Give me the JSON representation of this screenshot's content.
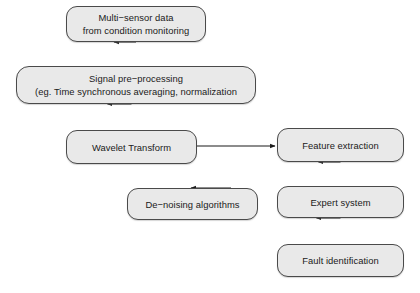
{
  "diagram": {
    "background_color": "#ffffff",
    "node_fill_color": "#e9e9e9",
    "node_border_color": "#4a4a4a",
    "edge_color": "#1a1a1a",
    "nodes": [
      {
        "id": "source",
        "lines": [
          "Multi−sensor data",
          "from condition monitoring"
        ]
      },
      {
        "id": "preprocess",
        "lines": [
          "Signal pre−processing",
          "(eg. Time synchronous averaging, normalization"
        ]
      },
      {
        "id": "wavelet",
        "lines": [
          "Wavelet Transform"
        ]
      },
      {
        "id": "denoise",
        "lines": [
          "De−noising algorithms"
        ]
      },
      {
        "id": "feature",
        "lines": [
          "Feature extraction"
        ]
      },
      {
        "id": "expert",
        "lines": [
          "Expert system"
        ]
      },
      {
        "id": "fault",
        "lines": [
          "Fault identification"
        ]
      }
    ],
    "edges": [
      {
        "id": "source-to-preprocess",
        "from": "source",
        "to": "preprocess",
        "direction": "down"
      },
      {
        "id": "preprocess-to-wavelet",
        "from": "preprocess",
        "to": "wavelet",
        "direction": "down"
      },
      {
        "id": "wavelet-to-feature",
        "from": "wavelet",
        "to": "feature",
        "direction": "right"
      },
      {
        "id": "denoise-to-wavelet-feature-link",
        "from": "denoise",
        "to": "wavelet-to-feature",
        "direction": "up"
      },
      {
        "id": "feature-to-expert",
        "from": "feature",
        "to": "expert",
        "direction": "down"
      },
      {
        "id": "expert-to-fault",
        "from": "expert",
        "to": "fault",
        "direction": "down"
      }
    ]
  }
}
